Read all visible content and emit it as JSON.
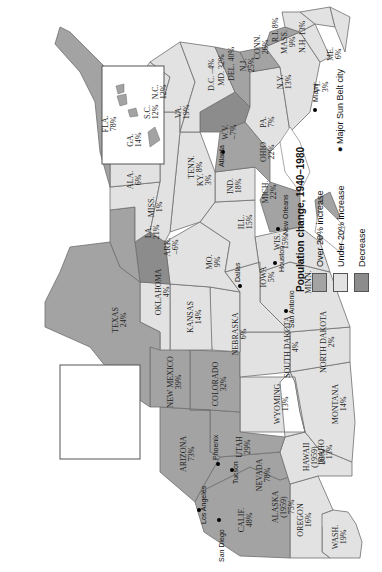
{
  "legend": {
    "title": "Population change, 1940–1980",
    "items": [
      {
        "key": "over20",
        "label": "Over 20% increase",
        "color": "#a3a3a3"
      },
      {
        "key": "under20",
        "label": "Under 20% increase",
        "color": "#e2e2e2"
      },
      {
        "key": "decrease",
        "label": "Decrease",
        "color": "#8c8c8c"
      }
    ],
    "city_marker_label": "Major Sun Belt city"
  },
  "states": [
    {
      "id": "wash",
      "name": "WASH.",
      "pct": "19%",
      "category": "under20"
    },
    {
      "id": "oregon",
      "name": "OREGON",
      "pct": "16%",
      "category": "under20"
    },
    {
      "id": "calif",
      "name": "CALIF.",
      "pct": "48%",
      "category": "over20"
    },
    {
      "id": "nevada",
      "name": "NEVADA",
      "pct": "78%",
      "category": "over20"
    },
    {
      "id": "idaho",
      "name": "IDAHO",
      "pct": "13%",
      "category": "under20"
    },
    {
      "id": "montana",
      "name": "MONTANA",
      "pct": "14%",
      "category": "under20"
    },
    {
      "id": "wyoming",
      "name": "WYOMING",
      "pct": "13%",
      "category": "under20"
    },
    {
      "id": "utah",
      "name": "UTAH",
      "pct": "29%",
      "category": "over20"
    },
    {
      "id": "arizona",
      "name": "ARIZONA",
      "pct": "73%",
      "category": "over20"
    },
    {
      "id": "colorado",
      "name": "COLORADO",
      "pct": "32%",
      "category": "over20"
    },
    {
      "id": "new_mexico",
      "name": "NEW MEXICO",
      "pct": "39%",
      "category": "over20"
    },
    {
      "id": "north_dakota",
      "name": "NORTH DAKOTA",
      "pct": "2%",
      "category": "under20"
    },
    {
      "id": "south_dakota",
      "name": "SOUTH DAKOTA",
      "pct": "4%",
      "category": "under20"
    },
    {
      "id": "nebraska",
      "name": "NEBRASKA",
      "pct": "6%",
      "category": "under20"
    },
    {
      "id": "kansas",
      "name": "KANSAS",
      "pct": "14%",
      "category": "under20"
    },
    {
      "id": "oklahoma",
      "name": "OKLAHOMA",
      "pct": "4%",
      "category": "under20"
    },
    {
      "id": "texas",
      "name": "TEXAS",
      "pct": "24%",
      "category": "over20"
    },
    {
      "id": "minn",
      "name": "MINN.",
      "pct": "14%",
      "category": "under20"
    },
    {
      "id": "iowa",
      "name": "IOWA",
      "pct": "5%",
      "category": "under20"
    },
    {
      "id": "mo",
      "name": "MO.",
      "pct": "9%",
      "category": "under20"
    },
    {
      "id": "ark",
      "name": "ARK.",
      "pct": "–6%",
      "category": "decrease"
    },
    {
      "id": "la",
      "name": "LA.",
      "pct": "21%",
      "category": "over20"
    },
    {
      "id": "wis",
      "name": "WIS.",
      "pct": "15%",
      "category": "under20"
    },
    {
      "id": "ill",
      "name": "ILL.",
      "pct": "15%",
      "category": "under20"
    },
    {
      "id": "miss",
      "name": "MISS.",
      "pct": "1%",
      "category": "under20"
    },
    {
      "id": "mich",
      "name": "MICH.",
      "pct": "22%",
      "category": "over20"
    },
    {
      "id": "ind",
      "name": "IND.",
      "pct": "18%",
      "category": "under20"
    },
    {
      "id": "ky",
      "name": "KY.",
      "pct": "3%",
      "category": "under20"
    },
    {
      "id": "tenn",
      "name": "TENN.",
      "pct": "8%",
      "category": "under20"
    },
    {
      "id": "ala",
      "name": "ALA.",
      "pct": "6%",
      "category": "under20"
    },
    {
      "id": "ohio",
      "name": "OHIO",
      "pct": "22%",
      "category": "over20"
    },
    {
      "id": "wv",
      "name": "W.V.",
      "pct": "–7%",
      "category": "decrease"
    },
    {
      "id": "ga",
      "name": "GA.",
      "pct": "14%",
      "category": "under20"
    },
    {
      "id": "fla",
      "name": "FLA.",
      "pct": "78%",
      "category": "over20"
    },
    {
      "id": "sc",
      "name": "S.C.",
      "pct": "12%",
      "category": "under20"
    },
    {
      "id": "nc",
      "name": "N.C.",
      "pct": "12%",
      "category": "under20"
    },
    {
      "id": "va",
      "name": "VA.",
      "pct": "19%",
      "category": "under20"
    },
    {
      "id": "pa",
      "name": "PA.",
      "pct": "7%",
      "category": "under20"
    },
    {
      "id": "ny",
      "name": "N.Y.",
      "pct": "13%",
      "category": "under20"
    },
    {
      "id": "vt",
      "name": "VT.",
      "pct": "3%",
      "category": "under20"
    },
    {
      "id": "me",
      "name": "ME.",
      "pct": "6%",
      "category": "under20"
    },
    {
      "id": "nh",
      "name": "N.H.",
      "pct": "13%",
      "category": "under20"
    },
    {
      "id": "mass",
      "name": "MASS.",
      "pct": "9%",
      "category": "under20"
    },
    {
      "id": "ri",
      "name": "R.I.",
      "pct": "8%",
      "category": "under20"
    },
    {
      "id": "conn",
      "name": "CONN.",
      "pct": "26%",
      "category": "over20"
    },
    {
      "id": "nj",
      "name": "N.J.",
      "pct": "25%",
      "category": "over20"
    },
    {
      "id": "del",
      "name": "DEL.",
      "pct": "40%",
      "category": "over20"
    },
    {
      "id": "md",
      "name": "MD.",
      "pct": "32%",
      "category": "over20"
    },
    {
      "id": "dc",
      "name": "D.C.",
      "pct": "–4%",
      "category": "decrease"
    },
    {
      "id": "alaska",
      "name": "ALASKA",
      "year": "(1959)",
      "pct": "75%",
      "category": "over20"
    },
    {
      "id": "hawaii",
      "name": "HAWAII",
      "year": "(1959)",
      "pct": "26%",
      "category": "over20"
    }
  ],
  "cities": [
    {
      "name": "Los Angeles"
    },
    {
      "name": "San Diego"
    },
    {
      "name": "Phoenix"
    },
    {
      "name": "Tucson"
    },
    {
      "name": "Dallas"
    },
    {
      "name": "San Antonio"
    },
    {
      "name": "Houston"
    },
    {
      "name": "New Orleans"
    },
    {
      "name": "Atlanta"
    },
    {
      "name": "Miami"
    }
  ]
}
